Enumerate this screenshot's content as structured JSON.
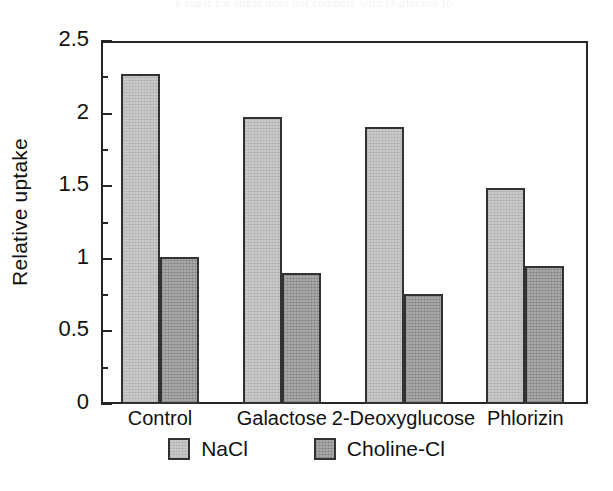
{
  "page": {
    "scan_remnant_text": "a sugar for sugar does not compete with D-glucose fo"
  },
  "chart_data": {
    "type": "bar",
    "title": "",
    "xlabel": "",
    "ylabel": "Relative uptake",
    "categories": [
      "Control",
      "Galactose",
      "2-Deoxyglucose",
      "Phlorizin"
    ],
    "series": [
      {
        "name": "NaCl",
        "values": [
          2.27,
          1.98,
          1.91,
          1.49
        ],
        "color": "#c9c9c9"
      },
      {
        "name": "Choline-Cl",
        "values": [
          1.01,
          0.9,
          0.76,
          0.95
        ],
        "color": "#a9a9a9"
      }
    ],
    "ylim": [
      0,
      2.5
    ],
    "y_major_ticks": [
      0,
      0.5,
      1,
      1.5,
      2,
      2.5
    ],
    "y_major_tick_labels": [
      "0",
      "0.5",
      "1",
      "1.5",
      "2",
      "2.5"
    ],
    "y_minor_ticks": [
      0.25,
      0.75,
      1.25,
      1.75,
      2.25
    ],
    "grid": false,
    "legend_position": "bottom",
    "legend_entries": [
      "NaCl",
      "Choline-Cl"
    ],
    "frame_color": "#262626",
    "bar_outline_color": "#323232"
  }
}
